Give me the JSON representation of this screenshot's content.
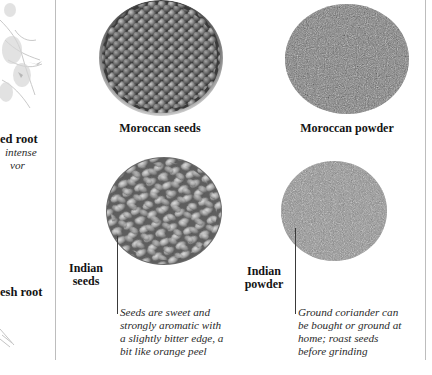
{
  "left_column": {
    "dried_root": {
      "label": "ed root",
      "caption_line1": "intense",
      "caption_line2": "vor"
    },
    "fresh_root": {
      "label": "esh root"
    }
  },
  "panels": {
    "moroccan_seeds": {
      "label": "Moroccan seeds",
      "image": "moroccan-seeds-pile"
    },
    "moroccan_powder": {
      "label": "Moroccan powder",
      "image": "moroccan-powder-pile"
    },
    "indian_seeds": {
      "label_line1": "Indian",
      "label_line2": "seeds",
      "image": "indian-seeds-pile",
      "caption": "Seeds are sweet and\nstrongly aromatic with\na slightly bitter edge, a\nbit like orange peel"
    },
    "indian_powder": {
      "label_line1": "Indian",
      "label_line2": "powder",
      "image": "indian-powder-pile",
      "caption": "Ground coriander can\nbe bought or ground at\nhome; roast seeds\nbefore grinding"
    }
  },
  "colors": {
    "background": "#ffffff",
    "divider": "#bdbdbd",
    "text": "#141414",
    "caption": "#2a2a2a",
    "leader_line": "#3a3a3a"
  }
}
